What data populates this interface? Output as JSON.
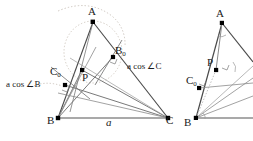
{
  "figure": {
    "colors": {
      "stroke_dark": "#2b2b2b",
      "stroke_mid": "#555555",
      "stroke_light": "#9a9a9a",
      "stroke_faint": "#bdbdbd",
      "dotted_arc": "#b8b0a8",
      "point_fill": "#000000",
      "background": "#ffffff"
    },
    "panels": [
      {
        "name": "main-figure",
        "vertices": [
          {
            "name": "A",
            "label": "A",
            "sub": "",
            "x": 93,
            "y": 22
          },
          {
            "name": "B",
            "label": "B",
            "sub": "",
            "x": 58,
            "y": 118
          },
          {
            "name": "C",
            "label": "C",
            "sub": "",
            "x": 168,
            "y": 118
          },
          {
            "name": "B0",
            "label": "B",
            "sub": "0",
            "x": 113,
            "y": 57
          },
          {
            "name": "C0",
            "label": "C",
            "sub": "0",
            "x": 65,
            "y": 85
          },
          {
            "name": "P",
            "label": "P",
            "sub": "",
            "x": 82,
            "y": 70
          }
        ],
        "point_labels": [
          {
            "name": "vertex-label-A",
            "text": "A",
            "sub": "",
            "x": 88,
            "y": 8
          },
          {
            "name": "vertex-label-B",
            "text": "B",
            "sub": "",
            "x": 50,
            "y": 121
          },
          {
            "name": "vertex-label-C",
            "text": "C",
            "sub": "",
            "x": 167,
            "y": 121
          },
          {
            "name": "vertex-label-B0",
            "text": "B",
            "sub": "0",
            "x": 116,
            "y": 48
          },
          {
            "name": "vertex-label-C0",
            "text": "C",
            "sub": "0",
            "x": 52,
            "y": 70
          },
          {
            "name": "vertex-label-P",
            "text": "P",
            "sub": "",
            "x": 84,
            "y": 71
          }
        ],
        "edge_labels": [
          {
            "name": "side-label-a",
            "text": "a",
            "x": 107,
            "y": 121,
            "italic": true
          },
          {
            "name": "length-label-acosC",
            "text": "a cos ∠C",
            "x": 128,
            "y": 66,
            "italic_lead": "a"
          },
          {
            "name": "length-label-acosB",
            "text": "a cos ∠B",
            "x": 8,
            "y": 84,
            "italic_lead": "a"
          }
        ]
      },
      {
        "name": "secondary-figure",
        "cropped": true,
        "point_labels": [
          {
            "name": "vertex-label-A2",
            "text": "A",
            "sub": "",
            "x": 217,
            "y": 11
          },
          {
            "name": "vertex-label-P2",
            "text": "P",
            "sub": "",
            "x": 208,
            "y": 62
          },
          {
            "name": "vertex-label-C02",
            "text": "C",
            "sub": "0",
            "x": 189,
            "y": 78
          },
          {
            "name": "vertex-label-B2",
            "text": "B",
            "sub": "",
            "x": 186,
            "y": 121
          }
        ]
      }
    ]
  }
}
